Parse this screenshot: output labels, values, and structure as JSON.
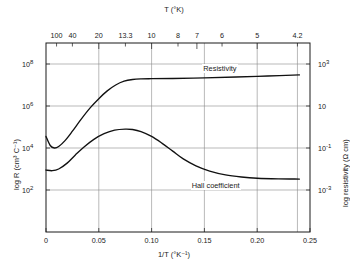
{
  "chart_data": {
    "type": "line",
    "title": "",
    "xlabel": "1/T  (°K⁻¹)",
    "ylabel": "log R  (cm³ C⁻¹)",
    "y2label": "log resistivity  (Ω cm)",
    "top_axis_label": "T  (°K)",
    "xlim": [
      0,
      0.25
    ],
    "ylim_log10": [
      0,
      9
    ],
    "y2lim_log10": [
      -5,
      4
    ],
    "grid": true,
    "legend_position": "inline-annotations",
    "xticks": [
      {
        "value": 0,
        "label": "0"
      },
      {
        "value": 0.05,
        "label": "0.05"
      },
      {
        "value": 0.1,
        "label": "0.10"
      },
      {
        "value": 0.15,
        "label": "0.15"
      },
      {
        "value": 0.2,
        "label": "0.20"
      },
      {
        "value": 0.25,
        "label": "0.25"
      }
    ],
    "top_ticks": [
      {
        "temperature": 100,
        "inv_t": 0.01,
        "label": "100",
        "major": false
      },
      {
        "temperature": 40,
        "inv_t": 0.025,
        "label": "40",
        "major": false
      },
      {
        "temperature": 20,
        "inv_t": 0.05,
        "label": "20",
        "major": true
      },
      {
        "temperature": 13.3,
        "inv_t": 0.0752,
        "label": "13.3",
        "major": false
      },
      {
        "temperature": 10,
        "inv_t": 0.1,
        "label": "10",
        "major": true
      },
      {
        "temperature": 8,
        "inv_t": 0.125,
        "label": "8",
        "major": false
      },
      {
        "temperature": 7,
        "inv_t": 0.1429,
        "label": "7",
        "major": true
      },
      {
        "temperature": 6,
        "inv_t": 0.1667,
        "label": "6",
        "major": false
      },
      {
        "temperature": 5,
        "inv_t": 0.2,
        "label": "5",
        "major": true
      },
      {
        "temperature": 4.2,
        "inv_t": 0.2381,
        "label": "4.2",
        "major": false
      }
    ],
    "yticks_left": [
      {
        "exp": 8,
        "mantissa": "10",
        "label": "8"
      },
      {
        "exp": 6,
        "mantissa": "10",
        "label": "6"
      },
      {
        "exp": 4,
        "mantissa": "10",
        "label": "4"
      },
      {
        "exp": 2,
        "mantissa": "10",
        "label": "2"
      }
    ],
    "yticks_right": [
      {
        "exp": 3,
        "mantissa": "10",
        "label": "3"
      },
      {
        "exp": 1,
        "mantissa": "10",
        "label": ""
      },
      {
        "exp": -1,
        "mantissa": "10",
        "label": "-1"
      },
      {
        "exp": -3,
        "mantissa": "10",
        "label": "-3"
      }
    ],
    "series": [
      {
        "name": "Resistivity",
        "annotation": "Resistivity",
        "axis": "right",
        "points": [
          {
            "x": 0.0,
            "log10_y": 4.55
          },
          {
            "x": 0.004,
            "log10_y": 4.12
          },
          {
            "x": 0.008,
            "log10_y": 4.0
          },
          {
            "x": 0.012,
            "log10_y": 4.07
          },
          {
            "x": 0.018,
            "log10_y": 4.35
          },
          {
            "x": 0.025,
            "log10_y": 4.8
          },
          {
            "x": 0.033,
            "log10_y": 5.35
          },
          {
            "x": 0.042,
            "log10_y": 5.92
          },
          {
            "x": 0.05,
            "log10_y": 6.35
          },
          {
            "x": 0.058,
            "log10_y": 6.72
          },
          {
            "x": 0.066,
            "log10_y": 7.0
          },
          {
            "x": 0.074,
            "log10_y": 7.18
          },
          {
            "x": 0.082,
            "log10_y": 7.26
          },
          {
            "x": 0.09,
            "log10_y": 7.29
          },
          {
            "x": 0.1,
            "log10_y": 7.3
          },
          {
            "x": 0.12,
            "log10_y": 7.31
          },
          {
            "x": 0.15,
            "log10_y": 7.34
          },
          {
            "x": 0.18,
            "log10_y": 7.38
          },
          {
            "x": 0.21,
            "log10_y": 7.43
          },
          {
            "x": 0.24,
            "log10_y": 7.48
          }
        ]
      },
      {
        "name": "Hall coefficient",
        "annotation": "Hall  coefficient",
        "axis": "left",
        "points": [
          {
            "x": 0.0,
            "log10_y": 2.95
          },
          {
            "x": 0.006,
            "log10_y": 2.92
          },
          {
            "x": 0.012,
            "log10_y": 3.0
          },
          {
            "x": 0.02,
            "log10_y": 3.28
          },
          {
            "x": 0.028,
            "log10_y": 3.68
          },
          {
            "x": 0.036,
            "log10_y": 4.05
          },
          {
            "x": 0.045,
            "log10_y": 4.4
          },
          {
            "x": 0.055,
            "log10_y": 4.68
          },
          {
            "x": 0.065,
            "log10_y": 4.85
          },
          {
            "x": 0.075,
            "log10_y": 4.9
          },
          {
            "x": 0.082,
            "log10_y": 4.88
          },
          {
            "x": 0.09,
            "log10_y": 4.78
          },
          {
            "x": 0.1,
            "log10_y": 4.55
          },
          {
            "x": 0.11,
            "log10_y": 4.22
          },
          {
            "x": 0.12,
            "log10_y": 3.85
          },
          {
            "x": 0.13,
            "log10_y": 3.48
          },
          {
            "x": 0.142,
            "log10_y": 3.15
          },
          {
            "x": 0.155,
            "log10_y": 2.9
          },
          {
            "x": 0.17,
            "log10_y": 2.72
          },
          {
            "x": 0.185,
            "log10_y": 2.62
          },
          {
            "x": 0.2,
            "log10_y": 2.56
          },
          {
            "x": 0.22,
            "log10_y": 2.53
          },
          {
            "x": 0.24,
            "log10_y": 2.52
          }
        ]
      }
    ]
  },
  "annotations": {
    "resistivity_label": "Resistivity",
    "hall_label": "Hall  coefficient"
  }
}
